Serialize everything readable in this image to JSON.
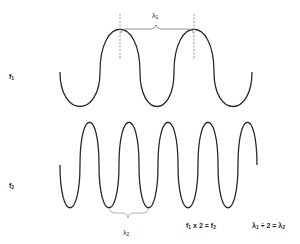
{
  "diagram": {
    "waves": [
      {
        "name": "f1",
        "label": "f",
        "subscript": "1",
        "cycles": 2.5,
        "x_start": 60,
        "x_end": 252,
        "y_mid": 70,
        "amplitude": 37
      },
      {
        "name": "f2",
        "label": "f",
        "subscript": "2",
        "cycles": 5,
        "x_start": 60,
        "x_end": 257,
        "y_mid": 164,
        "amplitude": 43
      }
    ],
    "wavelength_labels": {
      "lambda1": {
        "symbol": "λ",
        "subscript": "1"
      },
      "lambda2": {
        "symbol": "λ",
        "subscript": "2"
      }
    },
    "equations": {
      "frequency": {
        "a": "f",
        "a_sub": "1",
        "op": " x 2 = ",
        "b": "f",
        "b_sub": "2"
      },
      "wavelength": {
        "a": "λ",
        "a_sub": "1",
        "op": " ÷ 2 = ",
        "b": "λ",
        "b_sub": "2"
      }
    },
    "colors": {
      "stroke": "#2a2a2a",
      "dashed": "#999999",
      "brace": "#888888",
      "text": "#222222"
    }
  }
}
